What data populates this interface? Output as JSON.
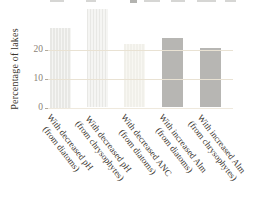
{
  "chart_data": {
    "type": "bar",
    "title": "",
    "ylabel": "Percentage of lakes",
    "xlabel": "",
    "categories": [
      "With decreased pH (from diatoms)",
      "With decreased pH (from chrysophytes)",
      "With decreased ANC (from diatoms)",
      "With increased Alm (from diatoms)",
      "With increased Alm (from chrysophytes)"
    ],
    "category_lines": [
      [
        "With decreased pH",
        "(from diatoms)"
      ],
      [
        "With decreased pH",
        "(from chrysophytes)"
      ],
      [
        "With decreased ANC",
        "(from diatoms)"
      ],
      [
        "With increased Alm",
        "(from diatoms)"
      ],
      [
        "With increased Alm",
        "(from chrysophytes)"
      ]
    ],
    "values": [
      27.5,
      34,
      22,
      24,
      20.5
    ],
    "yticks": [
      0,
      10,
      20
    ],
    "ytick_labels": [
      "0",
      "10",
      "20"
    ],
    "ylim": [
      0,
      37
    ],
    "grid": "horizontal gridlines at 10 and 20",
    "legend": "none",
    "bar_styles": [
      "striped",
      "striped",
      "ivory",
      "gray",
      "gray"
    ],
    "colors": {
      "bar_striped_dark": "#e8e8e5",
      "bar_striped_light": "#f5f5f3",
      "bar_ivory": "#f4f3ee",
      "bar_gray": "#b7b6b3",
      "gridline": "#e9e2d3",
      "baseline": "#efe9dd",
      "tick_label_text": "#8b8276",
      "axis_label_text": "#3a352e",
      "background": "#ffffff"
    }
  }
}
